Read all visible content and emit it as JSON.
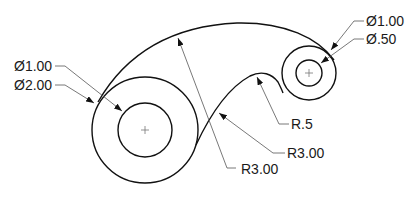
{
  "drawing": {
    "title": "Mechanical link profile drawing",
    "line_color": "#111111",
    "leader_color": "#555555",
    "dimensions": {
      "large_inner_dia": "Ø1.00",
      "large_outer_dia": "Ø2.00",
      "small_outer_dia": "Ø1.00",
      "small_inner_dia": "Ø.50",
      "fillet_radius": "R.5",
      "lower_arc_radius": "R3.00",
      "upper_arc_radius": "R3.00"
    },
    "icons": {
      "center_mark": "+"
    }
  }
}
